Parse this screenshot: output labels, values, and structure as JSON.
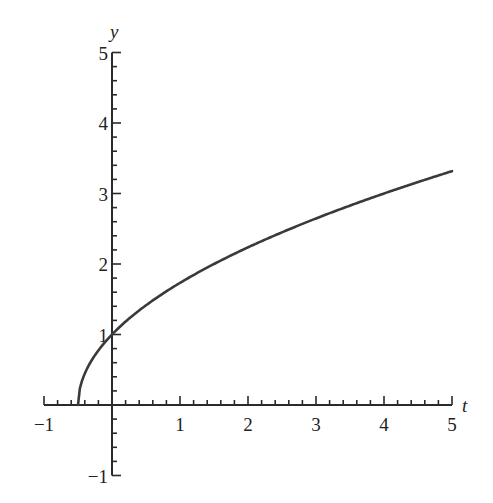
{
  "chart_data": {
    "type": "line",
    "title": "",
    "xlabel": "t",
    "ylabel": "y",
    "xlim": [
      -1,
      5
    ],
    "ylim": [
      -1,
      5
    ],
    "x_ticks": [
      -1,
      1,
      2,
      3,
      4,
      5
    ],
    "y_ticks": [
      5,
      4,
      3,
      2,
      1,
      -1
    ],
    "x_tick_labels": [
      "−1",
      "1",
      "2",
      "3",
      "4",
      "5"
    ],
    "y_tick_labels": [
      "5",
      "4",
      "3",
      "2",
      "1",
      "−1"
    ],
    "minor_tick_step": 0.2,
    "grid": false,
    "legend": null,
    "series": [
      {
        "name": "y(t)",
        "color": "#3a3a3a",
        "x": [
          -0.5,
          -0.45,
          -0.4,
          -0.3,
          -0.2,
          -0.1,
          0,
          0.25,
          0.5,
          0.75,
          1,
          1.5,
          2,
          2.5,
          3,
          3.5,
          4,
          4.5,
          5
        ],
        "y": [
          0,
          0.32,
          0.45,
          0.63,
          0.77,
          0.89,
          1.0,
          1.22,
          1.41,
          1.58,
          1.73,
          2.0,
          2.24,
          2.45,
          2.65,
          2.83,
          3.0,
          3.16,
          3.32
        ]
      }
    ]
  }
}
